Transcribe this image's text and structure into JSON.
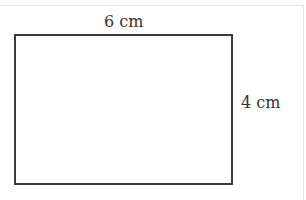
{
  "diagram": {
    "shape": "rectangle",
    "width_label": "6 cm",
    "height_label": "4 cm",
    "stroke_color": "#3a3a3a"
  }
}
